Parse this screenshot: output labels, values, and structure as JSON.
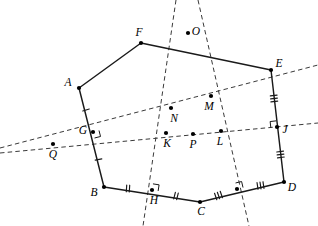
{
  "figure": {
    "canvas": {
      "width": 318,
      "height": 226
    },
    "background_color": "#ffffff",
    "stroke_color": "#1a1a1a",
    "dash_color": "#3a3a3a"
  },
  "chart_data": {
    "type": "diagram",
    "title": "",
    "points": [
      {
        "id": "A",
        "label": "A",
        "x": 79,
        "y": 88,
        "label_dx": -11,
        "label_dy": -5,
        "kind": "polygon-vertex"
      },
      {
        "id": "B",
        "label": "B",
        "x": 104,
        "y": 187,
        "label_dx": -10,
        "label_dy": 6,
        "kind": "polygon-vertex"
      },
      {
        "id": "C",
        "label": "C",
        "x": 200,
        "y": 202,
        "label_dx": 1,
        "label_dy": 10,
        "kind": "polygon-vertex"
      },
      {
        "id": "D",
        "label": "D",
        "x": 284,
        "y": 182,
        "label_dx": 8,
        "label_dy": 6,
        "kind": "polygon-vertex"
      },
      {
        "id": "E",
        "label": "E",
        "x": 271,
        "y": 70,
        "label_dx": 8,
        "label_dy": -6,
        "kind": "polygon-vertex"
      },
      {
        "id": "F",
        "label": "F",
        "x": 141,
        "y": 43,
        "label_dx": -2,
        "label_dy": -10,
        "kind": "polygon-vertex"
      },
      {
        "id": "G",
        "label": "G",
        "x": 93,
        "y": 132,
        "label_dx": -10,
        "label_dy": -1,
        "kind": "midpoint"
      },
      {
        "id": "H",
        "label": "H",
        "x": 152,
        "y": 190,
        "label_dx": 2,
        "label_dy": 11,
        "kind": "midpoint"
      },
      {
        "id": "J",
        "label": "J",
        "x": 277,
        "y": 127,
        "label_dx": 8,
        "label_dy": 3,
        "kind": "midpoint"
      },
      {
        "id": "K",
        "label": "K",
        "x": 166,
        "y": 133,
        "label_dx": 1,
        "label_dy": 11,
        "kind": "intersection"
      },
      {
        "id": "L",
        "label": "L",
        "x": 221,
        "y": 131,
        "label_dx": -1,
        "label_dy": 11,
        "kind": "intersection"
      },
      {
        "id": "M",
        "label": "M",
        "x": 211,
        "y": 96,
        "label_dx": -2,
        "label_dy": 11,
        "kind": "intersection"
      },
      {
        "id": "N",
        "label": "N",
        "x": 171,
        "y": 108,
        "label_dx": 3,
        "label_dy": 11,
        "kind": "intersection"
      },
      {
        "id": "O",
        "label": "O",
        "x": 188,
        "y": 33,
        "label_dx": 8,
        "label_dy": -1,
        "kind": "intersection"
      },
      {
        "id": "P",
        "label": "P",
        "x": 193,
        "y": 134,
        "label_dx": 0,
        "label_dy": 11,
        "kind": "intersection"
      },
      {
        "id": "Q",
        "label": "Q",
        "x": 53,
        "y": 144,
        "label_dx": 0,
        "label_dy": 11,
        "kind": "intersection"
      },
      {
        "id": "X",
        "label": "",
        "x": 237,
        "y": 189,
        "label_dx": 0,
        "label_dy": 0,
        "kind": "midpoint"
      }
    ],
    "polygon": {
      "name": "hexagon-ABCDEF",
      "vertex_order": [
        "A",
        "B",
        "C",
        "D",
        "E",
        "F"
      ],
      "closed": true
    },
    "polygon_edges": [
      {
        "id": "AB",
        "from": "A",
        "to": "B",
        "via": "G",
        "ticks_per_half": 1
      },
      {
        "id": "BC",
        "from": "B",
        "to": "C",
        "via": "H",
        "ticks_per_half": 2
      },
      {
        "id": "CD",
        "from": "C",
        "to": "D",
        "via": "X",
        "ticks_per_half": 3
      },
      {
        "id": "DE",
        "from": "D",
        "to": "E",
        "via": "J",
        "ticks_per_half": 3
      },
      {
        "id": "EF",
        "from": "E",
        "to": "F",
        "via": null,
        "ticks_per_half": 0
      },
      {
        "id": "FA",
        "from": "F",
        "to": "A",
        "via": null,
        "ticks_per_half": 0
      }
    ],
    "dashed_lines": [
      {
        "id": "line-Q-N-M",
        "x1": 0,
        "y1": 148,
        "x2": 318,
        "y2": 65,
        "through": [
          "Q",
          "G",
          "N",
          "M"
        ]
      },
      {
        "id": "line-Q-K-P-L-J",
        "x1": 0,
        "y1": 153,
        "x2": 318,
        "y2": 123,
        "through": [
          "Q",
          "K",
          "P",
          "L",
          "J"
        ]
      },
      {
        "id": "line-O-N-K-H",
        "x1": 176,
        "y1": 0,
        "x2": 143,
        "y2": 226,
        "through": [
          "O",
          "N",
          "K",
          "H"
        ]
      },
      {
        "id": "line-O-M-L-X",
        "x1": 198,
        "y1": 0,
        "x2": 249,
        "y2": 226,
        "through": [
          "O",
          "M",
          "L",
          "X"
        ]
      }
    ],
    "right_angle_marks": [
      {
        "at": "G",
        "id": "right-angle-G"
      },
      {
        "at": "H",
        "id": "right-angle-H"
      },
      {
        "at": "J",
        "id": "right-angle-J"
      },
      {
        "at": "X",
        "id": "right-angle-X"
      }
    ],
    "annotations": {
      "tick_legend": "Equal tick marks denote congruent half-segments (midpoints)",
      "right_angle_legend": "Small squares denote perpendicular bisectors"
    }
  }
}
